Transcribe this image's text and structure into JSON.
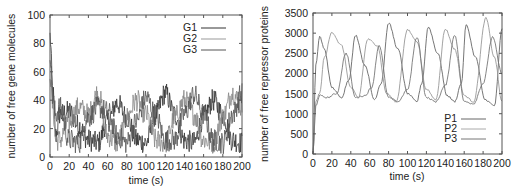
{
  "chart_data": [
    {
      "type": "line",
      "title": "",
      "xlabel": "time (s)",
      "ylabel": "number of free gene molecules",
      "xlim": [
        0,
        200
      ],
      "ylim": [
        0,
        100
      ],
      "xticks": [
        0,
        20,
        40,
        60,
        80,
        100,
        120,
        140,
        160,
        180,
        200
      ],
      "yticks": [
        0,
        20,
        40,
        60,
        80,
        100
      ],
      "grid": false,
      "legend_position": "upper right",
      "series": [
        {
          "name": "G1",
          "color": "#333333",
          "note": "noisy stochastic trace oscillating ~8-45",
          "x": [
            0,
            3,
            6,
            10,
            20,
            30,
            40,
            50,
            60,
            70,
            80,
            90,
            100,
            110,
            120,
            130,
            140,
            150,
            160,
            170,
            180,
            190,
            200
          ],
          "values": [
            85,
            45,
            15,
            30,
            32,
            22,
            12,
            10,
            25,
            38,
            28,
            12,
            10,
            30,
            45,
            30,
            12,
            10,
            28,
            40,
            30,
            12,
            10
          ]
        },
        {
          "name": "G2",
          "color": "#888888",
          "note": "noisy stochastic trace oscillating ~8-45",
          "x": [
            0,
            3,
            6,
            10,
            20,
            30,
            40,
            50,
            60,
            70,
            80,
            90,
            100,
            110,
            120,
            130,
            140,
            150,
            160,
            170,
            180,
            190,
            200
          ],
          "values": [
            60,
            35,
            12,
            12,
            25,
            35,
            30,
            45,
            15,
            10,
            28,
            40,
            30,
            12,
            10,
            28,
            40,
            30,
            12,
            10,
            28,
            45,
            35
          ]
        },
        {
          "name": "G3",
          "color": "#555555",
          "note": "noisy stochastic trace oscillating ~8-45",
          "x": [
            0,
            3,
            6,
            10,
            20,
            30,
            40,
            50,
            60,
            70,
            80,
            90,
            100,
            110,
            120,
            130,
            140,
            150,
            160,
            170,
            180,
            190,
            200
          ],
          "values": [
            75,
            40,
            30,
            35,
            12,
            10,
            28,
            35,
            32,
            15,
            10,
            25,
            42,
            30,
            12,
            12,
            30,
            44,
            30,
            12,
            10,
            30,
            45
          ]
        }
      ]
    },
    {
      "type": "line",
      "title": "",
      "xlabel": "time (s)",
      "ylabel": "number of free repressor proteins",
      "xlim": [
        0,
        200
      ],
      "ylim": [
        0,
        3500
      ],
      "xticks": [
        0,
        20,
        40,
        60,
        80,
        100,
        120,
        140,
        160,
        180,
        200
      ],
      "yticks": [
        0,
        500,
        1000,
        1500,
        2000,
        2500,
        3000,
        3500
      ],
      "grid": false,
      "legend_position": "lower right",
      "series": [
        {
          "name": "P1",
          "color": "#666666",
          "x": [
            0,
            3,
            7,
            12,
            20,
            30,
            38,
            45,
            55,
            65,
            72,
            80,
            90,
            100,
            110,
            115,
            122,
            132,
            142,
            150,
            157,
            162,
            172,
            182,
            192,
            200
          ],
          "values": [
            0,
            2200,
            2920,
            2600,
            1650,
            1400,
            1850,
            2950,
            2200,
            1350,
            1750,
            3250,
            2600,
            1500,
            1300,
            1750,
            3150,
            2500,
            1450,
            1300,
            1750,
            3200,
            2400,
            1350,
            1200,
            3100
          ]
        },
        {
          "name": "P2",
          "color": "#999999",
          "x": [
            0,
            3,
            7,
            12,
            20,
            30,
            40,
            48,
            58,
            68,
            78,
            88,
            100,
            110,
            120,
            130,
            140,
            150,
            160,
            170,
            183,
            192,
            200
          ],
          "values": [
            0,
            1300,
            1500,
            2400,
            3020,
            2700,
            1650,
            1400,
            2850,
            2700,
            1500,
            1300,
            3080,
            2800,
            1600,
            1350,
            3100,
            2600,
            1450,
            1300,
            3370,
            2400,
            1300
          ]
        },
        {
          "name": "P3",
          "color": "#777777",
          "x": [
            0,
            3,
            7,
            15,
            25,
            35,
            45,
            55,
            62,
            70,
            80,
            90,
            100,
            110,
            120,
            130,
            140,
            150,
            160,
            170,
            180,
            190,
            200
          ],
          "values": [
            0,
            1200,
            1450,
            1400,
            1500,
            2500,
            1400,
            1450,
            1650,
            2700,
            1400,
            1300,
            1600,
            2900,
            1400,
            1300,
            1700,
            2950,
            1300,
            1250,
            1750,
            2900,
            2000
          ]
        }
      ]
    }
  ],
  "left_chart": {
    "ylabel": "number of free gene molecules",
    "xlabel": "time (s)",
    "yticks": [
      "0",
      "20",
      "40",
      "60",
      "80",
      "100"
    ],
    "xticks": [
      "0",
      "20",
      "40",
      "60",
      "80",
      "100",
      "120",
      "140",
      "160",
      "180",
      "200"
    ],
    "legend": [
      "G1",
      "G2",
      "G3"
    ]
  },
  "right_chart": {
    "ylabel": "number of free repressor proteins",
    "xlabel": "time (s)",
    "yticks": [
      "0",
      "500",
      "1000",
      "1500",
      "2000",
      "2500",
      "3000",
      "3500"
    ],
    "xticks": [
      "0",
      "20",
      "40",
      "60",
      "80",
      "100",
      "120",
      "140",
      "160",
      "180",
      "200"
    ],
    "legend": [
      "P1",
      "P2",
      "P3"
    ]
  }
}
